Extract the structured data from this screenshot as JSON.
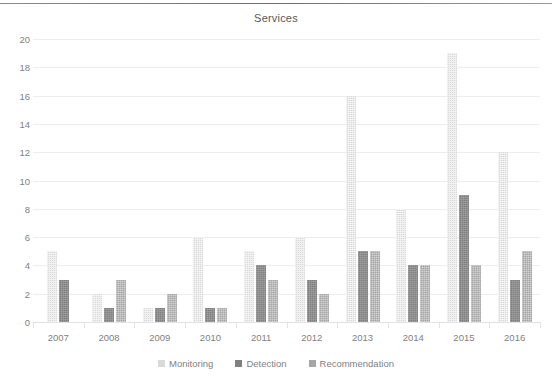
{
  "chart_data": {
    "type": "bar",
    "title": "Services",
    "xlabel": "",
    "ylabel": "",
    "ylim": [
      0,
      20
    ],
    "ytick_step": 2,
    "yticks": [
      0,
      2,
      4,
      6,
      8,
      10,
      12,
      14,
      16,
      18,
      20
    ],
    "grid": true,
    "legend_position": "bottom",
    "categories": [
      "2007",
      "2008",
      "2009",
      "2010",
      "2011",
      "2012",
      "2013",
      "2014",
      "2015",
      "2016"
    ],
    "series": [
      {
        "name": "Monitoring",
        "color": "#d9d9d9",
        "values": [
          5,
          2,
          1,
          6,
          5,
          6,
          16,
          8,
          19,
          12
        ]
      },
      {
        "name": "Detection",
        "color": "#808080",
        "values": [
          3,
          1,
          1,
          1,
          4,
          3,
          5,
          4,
          9,
          3
        ]
      },
      {
        "name": "Recommendation",
        "color": "#a6a6a6",
        "values": [
          null,
          3,
          2,
          1,
          3,
          2,
          5,
          4,
          4,
          5
        ]
      }
    ]
  },
  "axis": {
    "y_labels": [
      "20",
      "18",
      "16",
      "14",
      "12",
      "10",
      "8",
      "6",
      "4",
      "2",
      "0"
    ],
    "x_labels": [
      "2007",
      "2008",
      "2009",
      "2010",
      "2011",
      "2012",
      "2013",
      "2014",
      "2015",
      "2016"
    ]
  },
  "legend": {
    "items": [
      {
        "label": "Monitoring",
        "key": "monitoring"
      },
      {
        "label": "Detection",
        "key": "detection"
      },
      {
        "label": "Recommendation",
        "key": "recommendation"
      }
    ]
  }
}
